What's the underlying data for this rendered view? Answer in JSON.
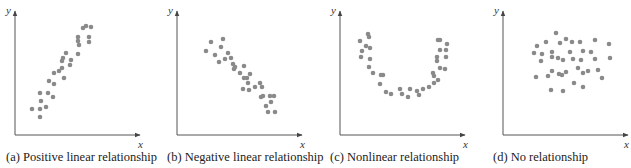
{
  "figure": {
    "panels": [
      {
        "id": "a",
        "caption": "(a) Positive linear relationship",
        "xlabel": "x",
        "ylabel": "y"
      },
      {
        "id": "b",
        "caption": "(b) Negative linear relationship",
        "xlabel": "x",
        "ylabel": "y"
      },
      {
        "id": "c",
        "caption": "(c) Nonlinear relationship",
        "xlabel": "x",
        "ylabel": "y"
      },
      {
        "id": "d",
        "caption": "(d) No relationship",
        "xlabel": "x",
        "ylabel": "y"
      }
    ],
    "colors": {
      "dot": "#8a8a8a",
      "axis": "#555555",
      "text": "#222222"
    }
  },
  "chart_data": [
    {
      "type": "scatter",
      "title": "(a) Positive linear relationship",
      "xlabel": "x",
      "ylabel": "y",
      "grid": false,
      "points_px": [
        [
          32,
          109
        ],
        [
          40,
          109
        ],
        [
          40,
          117
        ],
        [
          46,
          107
        ],
        [
          41,
          101
        ],
        [
          40,
          93
        ],
        [
          48,
          93
        ],
        [
          53,
          97
        ],
        [
          49,
          81
        ],
        [
          54,
          84
        ],
        [
          54,
          73
        ],
        [
          59,
          71
        ],
        [
          62,
          68
        ],
        [
          64,
          78
        ],
        [
          70,
          65
        ],
        [
          71,
          60
        ],
        [
          62,
          61
        ],
        [
          63,
          58
        ],
        [
          66,
          53
        ],
        [
          78,
          54
        ],
        [
          78,
          41
        ],
        [
          79,
          45
        ],
        [
          78,
          37
        ],
        [
          83,
          28
        ],
        [
          86,
          26
        ],
        [
          91,
          27
        ],
        [
          89,
          37
        ],
        [
          89,
          42
        ]
      ]
    },
    {
      "type": "scatter",
      "title": "(b) Negative linear relationship",
      "xlabel": "x",
      "ylabel": "y",
      "grid": false,
      "points_px": [
        [
          206,
          51
        ],
        [
          211,
          42
        ],
        [
          215,
          55
        ],
        [
          219,
          62
        ],
        [
          223,
          39
        ],
        [
          221,
          47
        ],
        [
          225,
          59
        ],
        [
          228,
          53
        ],
        [
          231,
          58
        ],
        [
          233,
          64
        ],
        [
          234,
          69
        ],
        [
          235,
          67
        ],
        [
          240,
          73
        ],
        [
          244,
          66
        ],
        [
          244,
          78
        ],
        [
          247,
          78
        ],
        [
          250,
          74
        ],
        [
          248,
          83
        ],
        [
          243,
          89
        ],
        [
          249,
          90
        ],
        [
          255,
          87
        ],
        [
          260,
          83
        ],
        [
          262,
          87
        ],
        [
          261,
          97
        ],
        [
          263,
          96
        ],
        [
          270,
          96
        ],
        [
          274,
          96
        ],
        [
          271,
          102
        ],
        [
          266,
          106
        ],
        [
          268,
          112
        ],
        [
          275,
          112
        ]
      ]
    },
    {
      "type": "scatter",
      "title": "(c) Nonlinear relationship",
      "xlabel": "x",
      "ylabel": "y",
      "grid": false,
      "points_px": [
        [
          360,
          41
        ],
        [
          362,
          51
        ],
        [
          361,
          57
        ],
        [
          368,
          34
        ],
        [
          369,
          37
        ],
        [
          366,
          46
        ],
        [
          370,
          48
        ],
        [
          370,
          59
        ],
        [
          369,
          67
        ],
        [
          373,
          73
        ],
        [
          381,
          75
        ],
        [
          383,
          75
        ],
        [
          380,
          84
        ],
        [
          386,
          92
        ],
        [
          391,
          94
        ],
        [
          400,
          89
        ],
        [
          402,
          94
        ],
        [
          408,
          97
        ],
        [
          410,
          89
        ],
        [
          417,
          91
        ],
        [
          419,
          95
        ],
        [
          423,
          89
        ],
        [
          429,
          87
        ],
        [
          434,
          83
        ],
        [
          433,
          73
        ],
        [
          434,
          76
        ],
        [
          438,
          80
        ],
        [
          440,
          68
        ],
        [
          445,
          69
        ],
        [
          437,
          57
        ],
        [
          437,
          61
        ],
        [
          440,
          50
        ],
        [
          446,
          50
        ],
        [
          446,
          57
        ],
        [
          447,
          44
        ],
        [
          438,
          40
        ],
        [
          440,
          40
        ]
      ]
    },
    {
      "type": "scatter",
      "title": "(d) No relationship",
      "xlabel": "x",
      "ylabel": "y",
      "grid": false,
      "points_px": [
        [
          556,
          33
        ],
        [
          537,
          46
        ],
        [
          546,
          42
        ],
        [
          534,
          53
        ],
        [
          542,
          54
        ],
        [
          541,
          61
        ],
        [
          552,
          52
        ],
        [
          560,
          43
        ],
        [
          566,
          39
        ],
        [
          572,
          42
        ],
        [
          580,
          42
        ],
        [
          595,
          40
        ],
        [
          609,
          44
        ],
        [
          610,
          58
        ],
        [
          552,
          57
        ],
        [
          558,
          58
        ],
        [
          563,
          60
        ],
        [
          570,
          52
        ],
        [
          573,
          59
        ],
        [
          581,
          60
        ],
        [
          583,
          51
        ],
        [
          591,
          52
        ],
        [
          595,
          59
        ],
        [
          578,
          68
        ],
        [
          583,
          73
        ],
        [
          588,
          71
        ],
        [
          598,
          70
        ],
        [
          602,
          78
        ],
        [
          552,
          71
        ],
        [
          559,
          74
        ],
        [
          562,
          75
        ],
        [
          566,
          72
        ],
        [
          536,
          77
        ],
        [
          548,
          76
        ],
        [
          574,
          83
        ],
        [
          583,
          87
        ],
        [
          551,
          90
        ],
        [
          563,
          91
        ]
      ]
    }
  ]
}
